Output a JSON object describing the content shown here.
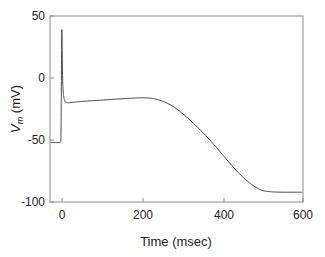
{
  "chart_data": {
    "type": "line",
    "title": "",
    "xlabel": "Time (msec)",
    "ylabel": "V_m (mV)",
    "ylabel_parts": {
      "symbol": "V",
      "subscript": "m",
      "units": " (mV)"
    },
    "xlim": [
      -30,
      630
    ],
    "ylim": [
      -100,
      50
    ],
    "xticks": [
      0,
      200,
      400,
      600
    ],
    "xtick_labels": [
      "0",
      "200",
      "400",
      "600"
    ],
    "yticks": [
      -100,
      -50,
      0,
      50
    ],
    "ytick_labels": [
      "-100",
      "-50",
      "0",
      "50"
    ],
    "grid": false,
    "legend": null,
    "line_color": "#4d4d4d",
    "frame_color": "#8c8c8c",
    "background": "#ffffff",
    "series": [
      {
        "name": "membrane potential",
        "x": [
          -28,
          -20,
          -12,
          -6,
          -3,
          -1.5,
          -0.6,
          0,
          0.6,
          1.2,
          1.8,
          2.4,
          3.2,
          4.2,
          5.4,
          6.6,
          8,
          9.5,
          11,
          13,
          15,
          18,
          22,
          27,
          33,
          40,
          50,
          62,
          76,
          92,
          110,
          130,
          150,
          170,
          190,
          205,
          218,
          230,
          240,
          250,
          262,
          275,
          288,
          300,
          315,
          330,
          345,
          360,
          375,
          390,
          405,
          420,
          435,
          450,
          462,
          474,
          486,
          496,
          505,
          513,
          520,
          528,
          537,
          548,
          562,
          578,
          596,
          612,
          626
        ],
        "y": [
          -52,
          -52,
          -52,
          -52,
          -52,
          -48,
          -20,
          15,
          38,
          34,
          22,
          8,
          -3,
          -10,
          -14,
          -16.5,
          -18,
          -19,
          -19.5,
          -19.8,
          -20,
          -20,
          -19.9,
          -19.7,
          -19.5,
          -19.3,
          -19,
          -18.7,
          -18.4,
          -18.1,
          -17.7,
          -17.3,
          -16.9,
          -16.5,
          -16.2,
          -16,
          -16,
          -16.2,
          -16.6,
          -17.3,
          -18.5,
          -20.2,
          -22.3,
          -24.8,
          -28.5,
          -32.5,
          -36.8,
          -41.3,
          -46,
          -51,
          -56.3,
          -61.8,
          -67.3,
          -72.6,
          -76.5,
          -80.2,
          -83.5,
          -85.9,
          -87.8,
          -89.2,
          -90.2,
          -91,
          -91.5,
          -91.8,
          -92,
          -92.1,
          -92.1,
          -92.1,
          -92.1
        ]
      }
    ],
    "annotations": []
  },
  "figure": {
    "width": 325,
    "height": 257
  }
}
